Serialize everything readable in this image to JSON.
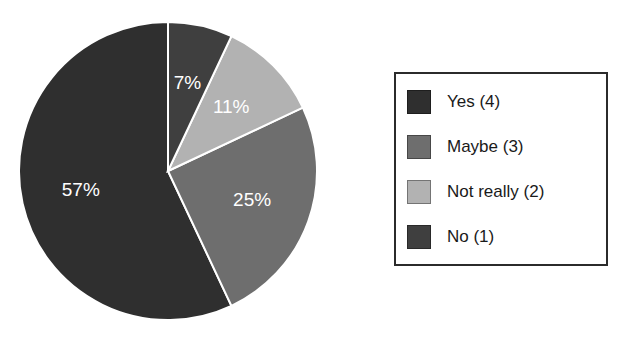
{
  "chart_data": {
    "type": "pie",
    "title": "",
    "subtitle": "",
    "xlabel": "",
    "ylabel": "",
    "grid": false,
    "legend_position": "right",
    "start_angle_deg": 90,
    "direction": "counterclockwise",
    "categories": [
      "Yes (4)",
      "Maybe (3)",
      "Not really (2)",
      "No (1)"
    ],
    "values": [
      57,
      25,
      11,
      7
    ],
    "counts": [
      4,
      3,
      2,
      1
    ],
    "data_labels": [
      "57%",
      "25%",
      "11%",
      "7%"
    ],
    "colors": [
      "#2f2f2f",
      "#6e6e6e",
      "#b2b2b2",
      "#3f3f3f"
    ],
    "slice_border_color": "#ffffff",
    "data_label_color": "#ffffff",
    "slices": [
      {
        "label": "Yes (4)",
        "percent_label": "57%",
        "value": 57,
        "count": 4,
        "color": "#2f2f2f"
      },
      {
        "label": "Maybe (3)",
        "percent_label": "25%",
        "value": 25,
        "count": 3,
        "color": "#6e6e6e"
      },
      {
        "label": "Not really (2)",
        "percent_label": "11%",
        "value": 11,
        "count": 2,
        "color": "#b2b2b2"
      },
      {
        "label": "No (1)",
        "percent_label": "7%",
        "value": 7,
        "count": 1,
        "color": "#3f3f3f"
      }
    ]
  },
  "legend": {
    "items": [
      {
        "label": "Yes (4)",
        "color": "#2f2f2f"
      },
      {
        "label": "Maybe (3)",
        "color": "#6e6e6e"
      },
      {
        "label": "Not really (2)",
        "color": "#b2b2b2"
      },
      {
        "label": "No (1)",
        "color": "#3f3f3f"
      }
    ]
  }
}
